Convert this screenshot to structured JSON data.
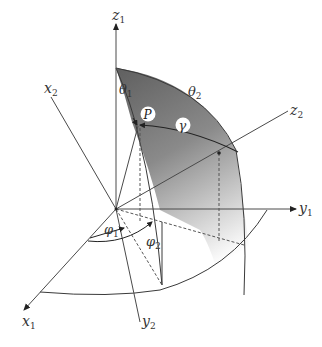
{
  "diagram": {
    "title": "",
    "frame1_axes": {
      "x": {
        "label": "x",
        "sub": "1"
      },
      "y": {
        "label": "y",
        "sub": "1"
      },
      "z": {
        "label": "z",
        "sub": "1"
      }
    },
    "frame2_axes": {
      "x": {
        "label": "x",
        "sub": "2"
      },
      "y": {
        "label": "y",
        "sub": "2"
      },
      "z": {
        "label": "z",
        "sub": "2"
      }
    },
    "angles": {
      "theta1": {
        "label": "θ",
        "sub": "1"
      },
      "theta2": {
        "label": "θ",
        "sub": "2"
      },
      "phi1": {
        "label": "φ",
        "sub": "1"
      },
      "phi2": {
        "label": "φ",
        "sub": "2"
      },
      "gamma": {
        "label": "γ"
      }
    },
    "point": {
      "label": "P"
    },
    "colors": {
      "line": "#4a4a4a",
      "surface_dark": "#6e6e6e",
      "surface_light": "#ffffff",
      "label_bg": "#ffffff"
    }
  }
}
